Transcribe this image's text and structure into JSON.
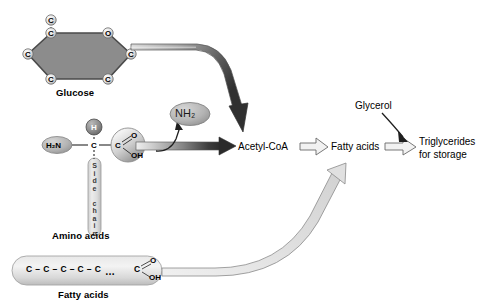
{
  "figure": {
    "type": "biochemical-pathway-diagram",
    "background_color": "#ffffff"
  },
  "molecules": {
    "glucose": {
      "name": "Glucose",
      "ring_atoms": [
        "C",
        "O",
        "C",
        "C",
        "C",
        "C"
      ],
      "exocyclic_atom": "C",
      "vertex_labels": {
        "top_left": "C",
        "top_right": "O",
        "right": "C",
        "bottom_right": "C",
        "bottom_left": "C",
        "left": "C",
        "above_top_left": "C"
      },
      "fill_color": "#8c8c8c"
    },
    "amino_acid": {
      "name": "Amino acids",
      "amino_group": "H2N",
      "amino_group_display": "H₂N",
      "hydrogen": "H",
      "alpha_carbon": "C",
      "carboxyl_carbon": "C",
      "carbonyl_oxygen": "O",
      "hydroxyl": "OH",
      "side_chain_label": "Side chain",
      "side_chain_letters": [
        "S",
        "i",
        "d",
        "e",
        "c",
        "h",
        "a",
        "i",
        "n"
      ]
    },
    "fatty_acid_molecule": {
      "name": "Fatty acids",
      "chain": "C – C – C – C – C",
      "chain_atoms": [
        "C",
        "C",
        "C",
        "C",
        "C"
      ],
      "ellipsis": "…",
      "terminal_carbon": "C",
      "carbonyl_oxygen": "O",
      "hydroxyl": "OH"
    },
    "nh2_bubble": {
      "label": "NH2",
      "label_display": "NH₂",
      "fill_color": "#b0b0b0"
    }
  },
  "nodes": {
    "acetyl_coa": "Acetyl-CoA",
    "fatty_acids": "Fatty acids",
    "glycerol": "Glycerol",
    "triglycerides": "Triglycerides\nfor storage",
    "triglycerides_line1": "Triglycerides",
    "triglycerides_line2": "for storage"
  },
  "arrows": [
    {
      "name": "glucose-to-acetyl-coa",
      "from": "Glucose",
      "to": "Acetyl-CoA",
      "style": "curved-gradient-ribbon",
      "shade": "light-to-dark"
    },
    {
      "name": "amino-acids-to-acetyl-coa",
      "from": "Amino acids",
      "to": "Acetyl-CoA",
      "style": "straight-gradient-ribbon",
      "shade": "light-to-dark"
    },
    {
      "name": "amino-acids-to-nh2",
      "from": "Amino acids",
      "to": "NH2",
      "style": "thin-curved"
    },
    {
      "name": "acetyl-coa-to-fatty-acids",
      "from": "Acetyl-CoA",
      "to": "Fatty acids",
      "style": "open-outline"
    },
    {
      "name": "fatty-acid-molecule-to-fatty-acids",
      "from": "Fatty acids (molecule)",
      "to": "Fatty acids",
      "style": "curved-open-ribbon"
    },
    {
      "name": "fatty-acids-to-triglycerides",
      "from": "Fatty acids",
      "to": "Triglycerides for storage",
      "style": "open-outline"
    },
    {
      "name": "glycerol-to-triglycerides",
      "from": "Glycerol",
      "to": "Triglycerides for storage",
      "style": "thin-curved"
    }
  ],
  "colors": {
    "glucose_fill": "#8c8c8c",
    "atom_circle_fill": "#e8e8e8",
    "nh2_fill": "#b0b0b0",
    "capsule_fill": "#dcdcdc",
    "arrow_dark": "#3a3a3a",
    "arrow_light": "#d8d8d8",
    "outline": "#555555",
    "text": "#000000"
  }
}
